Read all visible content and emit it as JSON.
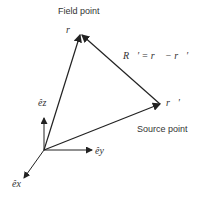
{
  "labels": {
    "field_point": "Field point",
    "source_point": "Source point",
    "field_vector": "r⃗",
    "source_vector": "r⃗′",
    "relation": "R⃗′ = r⃗ − r⃗′",
    "e_x": "êx",
    "e_y": "êy",
    "e_z": "êz"
  },
  "colors": {
    "line": "#222222",
    "text": "#333333"
  }
}
